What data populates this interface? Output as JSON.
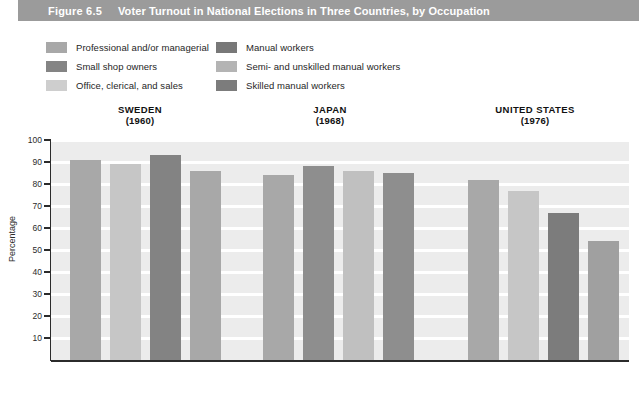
{
  "title_bar": {
    "figure_number": "Figure 6.5",
    "title": "Voter Turnout in National Elections in Three Countries, by Occupation",
    "bar_color": "#9b9b9b",
    "text_color": "#ffffff"
  },
  "legend": {
    "left_items": [
      {
        "label": "Professional and/or managerial",
        "color": "#a8a8a8"
      },
      {
        "label": "Small shop owners",
        "color": "#848484"
      },
      {
        "label": "Office, clerical, and sales",
        "color": "#cecece"
      }
    ],
    "right_items": [
      {
        "label": "Manual workers",
        "color": "#787878"
      },
      {
        "label": "Semi- and unskilled manual workers",
        "color": "#b4b4b4"
      },
      {
        "label": "Skilled manual workers",
        "color": "#7c7c7c"
      }
    ]
  },
  "groups": [
    {
      "name": "SWEDEN",
      "year": "(1960)"
    },
    {
      "name": "JAPAN",
      "year": "(1968)"
    },
    {
      "name": "UNITED STATES",
      "year": "(1976)"
    }
  ],
  "axis": {
    "y_title": "Percentage",
    "y_ticks": [
      "100",
      "90",
      "80",
      "70",
      "60",
      "50",
      "40",
      "30",
      "20",
      "10"
    ],
    "y_min": 0,
    "y_max": 100
  },
  "colors": {
    "plot_background": "#ececec",
    "gridline": "#ffffff",
    "axis": "#2b2b2b"
  },
  "chart_data": {
    "type": "bar",
    "title": "Voter Turnout in National Elections in Three Countries, by Occupation",
    "xlabel": "",
    "ylabel": "Percentage",
    "ylim": [
      0,
      100
    ],
    "ytick_step": 10,
    "grid": true,
    "legend_position": "top",
    "categories": [
      "SWEDEN (1960)",
      "JAPAN (1968)",
      "UNITED STATES (1976)"
    ],
    "groups": [
      {
        "name": "SWEDEN",
        "year": "(1960)",
        "bars": [
          {
            "series": "Professional and/or managerial",
            "value": 91,
            "color": "#a8a8a8"
          },
          {
            "series": "Office, clerical, and sales",
            "value": 89,
            "color": "#c6c6c6"
          },
          {
            "series": "Small shop owners",
            "value": 93,
            "color": "#838383"
          },
          {
            "series": "Manual workers",
            "value": 86,
            "color": "#a8a8a8"
          }
        ]
      },
      {
        "name": "JAPAN",
        "year": "(1968)",
        "bars": [
          {
            "series": "Professional and/or managerial",
            "value": 84,
            "color": "#a8a8a8"
          },
          {
            "series": "Small shop owners",
            "value": 88,
            "color": "#8e8e8e"
          },
          {
            "series": "Office, clerical, and sales",
            "value": 86,
            "color": "#c0c0c0"
          },
          {
            "series": "Manual workers",
            "value": 85,
            "color": "#8e8e8e"
          }
        ]
      },
      {
        "name": "UNITED STATES",
        "year": "(1976)",
        "bars": [
          {
            "series": "Professional and/or managerial",
            "value": 82,
            "color": "#a8a8a8"
          },
          {
            "series": "Office, clerical, and sales",
            "value": 77,
            "color": "#c6c6c6"
          },
          {
            "series": "Skilled manual workers",
            "value": 67,
            "color": "#7c7c7c"
          },
          {
            "series": "Semi- and unskilled manual workers",
            "value": 54,
            "color": "#a0a0a0"
          }
        ]
      }
    ]
  },
  "layout": {
    "bar_geometry": [
      {
        "left": 70,
        "width": 31
      },
      {
        "left": 110,
        "width": 31
      },
      {
        "left": 150,
        "width": 31
      },
      {
        "left": 190,
        "width": 31
      },
      {
        "left": 263,
        "width": 31
      },
      {
        "left": 303,
        "width": 31
      },
      {
        "left": 343,
        "width": 31
      },
      {
        "left": 383,
        "width": 31
      },
      {
        "left": 468,
        "width": 31
      },
      {
        "left": 508,
        "width": 31
      },
      {
        "left": 548,
        "width": 31
      },
      {
        "left": 588,
        "width": 31
      }
    ]
  }
}
